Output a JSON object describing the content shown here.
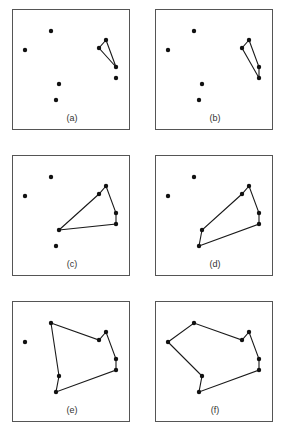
{
  "figure": {
    "points": {
      "A": [
        38,
        21
      ],
      "B": [
        12,
        40
      ],
      "C": [
        93,
        30
      ],
      "D": [
        86,
        38
      ],
      "E": [
        103,
        57
      ],
      "F": [
        103,
        68
      ],
      "G": [
        46,
        74
      ],
      "H": [
        43,
        90
      ]
    },
    "panels": [
      {
        "label": "(a)",
        "x": 12,
        "y": 9,
        "points": [
          "A",
          "B",
          "C",
          "D",
          "E",
          "F",
          "G",
          "H"
        ],
        "hull": [
          "C",
          "D",
          "E",
          "C"
        ]
      },
      {
        "label": "(b)",
        "x": 155,
        "y": 9,
        "points": [
          "A",
          "B",
          "C",
          "D",
          "E",
          "F",
          "G",
          "H"
        ],
        "hull": [
          "C",
          "D",
          "F",
          "E",
          "C"
        ]
      },
      {
        "label": "(c)",
        "x": 12,
        "y": 155,
        "points": [
          "A",
          "B",
          "C",
          "D",
          "E",
          "F",
          "G",
          "H"
        ],
        "hull": [
          "G",
          "D",
          "C",
          "E",
          "F",
          "G"
        ]
      },
      {
        "label": "(d)",
        "x": 155,
        "y": 155,
        "points": [
          "A",
          "B",
          "C",
          "D",
          "E",
          "F",
          "G",
          "H"
        ],
        "hull": [
          "H",
          "G",
          "D",
          "C",
          "E",
          "F",
          "H"
        ]
      },
      {
        "label": "(e)",
        "x": 12,
        "y": 301,
        "points": [
          "A",
          "B",
          "C",
          "D",
          "E",
          "F",
          "G",
          "H"
        ],
        "hull": [
          "A",
          "D",
          "C",
          "E",
          "F",
          "H",
          "G",
          "A"
        ]
      },
      {
        "label": "(f)",
        "x": 155,
        "y": 301,
        "points": [
          "A",
          "B",
          "C",
          "D",
          "E",
          "F",
          "G",
          "H"
        ],
        "hull": [
          "B",
          "A",
          "D",
          "C",
          "E",
          "F",
          "H",
          "G",
          "B"
        ]
      }
    ],
    "colors": {
      "stroke": "#1a1a1a",
      "frame": "#555555",
      "point": "#111111"
    }
  }
}
